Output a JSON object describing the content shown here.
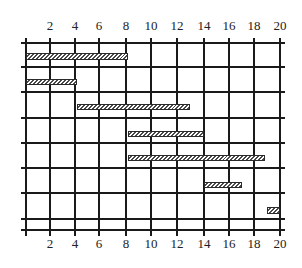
{
  "chart_data": {
    "type": "gantt",
    "title": "",
    "xlabel": "",
    "ylabel": "",
    "x_ticks": [
      2,
      4,
      6,
      8,
      10,
      12,
      14,
      16,
      18,
      20
    ],
    "xlim": [
      0,
      20
    ],
    "grid": true,
    "tick_labels_top": true,
    "tick_labels_bottom": true,
    "rows": 7,
    "bars": [
      {
        "row": 1,
        "start": 0,
        "end": 8
      },
      {
        "row": 2,
        "start": 0,
        "end": 4
      },
      {
        "row": 3,
        "start": 4,
        "end": 12.9
      },
      {
        "row": 4,
        "start": 8,
        "end": 14
      },
      {
        "row": 5,
        "start": 8,
        "end": 18.8
      },
      {
        "row": 6,
        "start": 14,
        "end": 17
      },
      {
        "row": 7,
        "start": 19,
        "end": 20
      }
    ],
    "bar_fill": "hatched",
    "colors": {
      "line": "#1a1a1a",
      "bar_border": "#2a2a2a",
      "hatch": "#4a4a4a",
      "background": "#ffffff"
    }
  },
  "layout": {
    "x0_px": 26,
    "px_per_unit": 12.7,
    "v_line_x": [
      26,
      50,
      75,
      99,
      126,
      151,
      177,
      204,
      229,
      254,
      280
    ],
    "v_line_top": 38,
    "v_line_bottom": 236,
    "h_line_y": [
      43,
      67,
      92,
      118,
      143,
      168,
      193,
      219,
      230
    ],
    "h_line_left": 21,
    "h_line_right": 285,
    "bar_y": [
      [
        53,
        59
      ],
      [
        79,
        84
      ],
      [
        104,
        109
      ],
      [
        131,
        136
      ],
      [
        155,
        160
      ],
      [
        182,
        187
      ],
      [
        207,
        213
      ]
    ],
    "top_label_y": 18,
    "bottom_label_y": 236
  }
}
